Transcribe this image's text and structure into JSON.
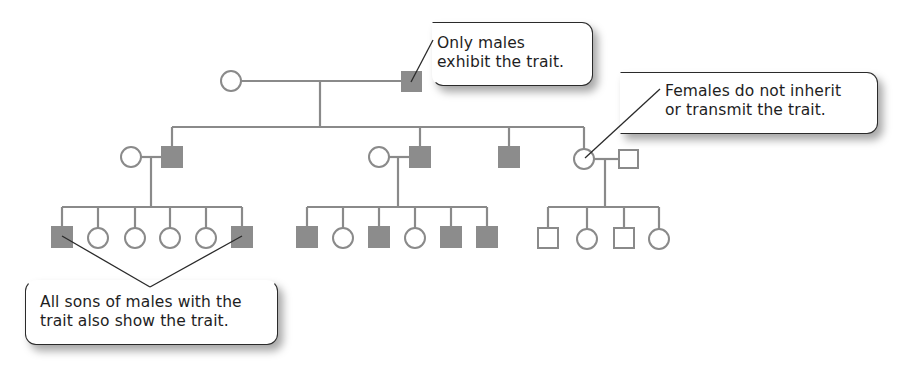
{
  "diagram": {
    "type": "pedigree",
    "colors": {
      "line": "#8a8a8a",
      "affected_fill": "#8c8c8c",
      "unaffected_fill": "#ffffff",
      "callout_border": "#2a2a2a",
      "text": "#1e1e1e"
    },
    "legend_symbols": {
      "square": "male",
      "circle": "female",
      "filled": "affected (shows trait)",
      "open": "unaffected"
    },
    "generations": [
      {
        "label": "I",
        "individuals": [
          {
            "id": "I-1",
            "sex": "female",
            "affected": false
          },
          {
            "id": "I-2",
            "sex": "male",
            "affected": true
          }
        ]
      },
      {
        "label": "II",
        "individuals": [
          {
            "id": "II-1",
            "sex": "female",
            "affected": false,
            "note": "spouse"
          },
          {
            "id": "II-2",
            "sex": "male",
            "affected": true
          },
          {
            "id": "II-3",
            "sex": "female",
            "affected": false,
            "note": "spouse"
          },
          {
            "id": "II-4",
            "sex": "male",
            "affected": true
          },
          {
            "id": "II-5",
            "sex": "male",
            "affected": true
          },
          {
            "id": "II-6",
            "sex": "female",
            "affected": false
          },
          {
            "id": "II-7",
            "sex": "male",
            "affected": false,
            "note": "spouse"
          }
        ]
      },
      {
        "label": "III",
        "families": [
          {
            "parents": [
              "II-1",
              "II-2"
            ],
            "children": [
              {
                "sex": "male",
                "affected": true
              },
              {
                "sex": "female",
                "affected": false
              },
              {
                "sex": "female",
                "affected": false
              },
              {
                "sex": "female",
                "affected": false
              },
              {
                "sex": "female",
                "affected": false
              },
              {
                "sex": "male",
                "affected": true
              }
            ]
          },
          {
            "parents": [
              "II-3",
              "II-4"
            ],
            "children": [
              {
                "sex": "male",
                "affected": true
              },
              {
                "sex": "female",
                "affected": false
              },
              {
                "sex": "male",
                "affected": true
              },
              {
                "sex": "female",
                "affected": false
              },
              {
                "sex": "male",
                "affected": true
              },
              {
                "sex": "male",
                "affected": true
              }
            ]
          },
          {
            "parents": [
              "II-6",
              "II-7"
            ],
            "children": [
              {
                "sex": "male",
                "affected": false
              },
              {
                "sex": "female",
                "affected": false
              },
              {
                "sex": "male",
                "affected": false
              },
              {
                "sex": "female",
                "affected": false
              }
            ]
          }
        ]
      }
    ],
    "callouts": {
      "top": {
        "line1": "Only males",
        "line2": "exhibit the trait."
      },
      "right": {
        "line1": "Females do not inherit",
        "line2": "or transmit the trait."
      },
      "bottom": {
        "line1": "All sons of males with the",
        "line2": "trait also show the trait."
      }
    }
  }
}
